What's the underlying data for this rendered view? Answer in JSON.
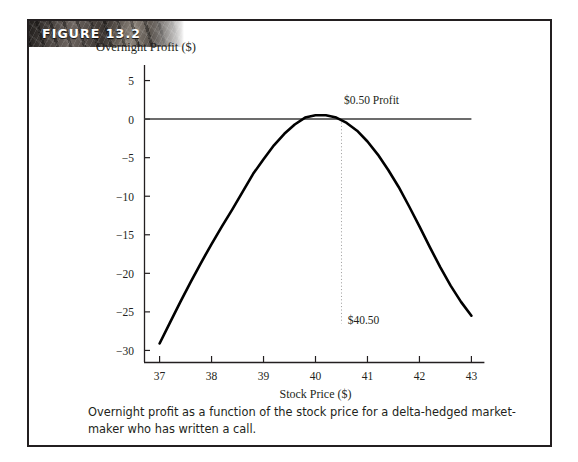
{
  "figure": {
    "banner_label": "FIGURE 13.2",
    "caption": "Overnight profit as a function of the stock price for a delta-hedged market-maker who has written a call."
  },
  "chart_data": {
    "type": "line",
    "title": "",
    "xlabel": "Stock Price ($)",
    "ylabel": "Overnight Profit ($)",
    "xlim": [
      36.7,
      43.3
    ],
    "ylim": [
      -31.5,
      6.5
    ],
    "xticks": [
      37,
      38,
      39,
      40,
      41,
      42,
      43
    ],
    "xtick_labels": [
      "37",
      "38",
      "39",
      "40",
      "41",
      "42",
      "43"
    ],
    "yticks": [
      5,
      0,
      -5,
      -10,
      -15,
      -20,
      -25,
      -30
    ],
    "ytick_labels": [
      "5",
      "0",
      "−5",
      "−10",
      "−15",
      "−20",
      "−25",
      "−30"
    ],
    "grid": false,
    "legend": null,
    "series": [
      {
        "name": "Overnight profit",
        "x": [
          37.0,
          37.2,
          37.4,
          37.6,
          37.8,
          38.0,
          38.2,
          38.4,
          38.6,
          38.8,
          39.0,
          39.2,
          39.4,
          39.6,
          39.8,
          40.0,
          40.2,
          40.4,
          40.6,
          40.8,
          41.0,
          41.2,
          41.4,
          41.6,
          41.8,
          42.0,
          42.2,
          42.4,
          42.6,
          42.8,
          43.0
        ],
        "y": [
          -29.1,
          -26.4,
          -23.7,
          -21.1,
          -18.6,
          -16.2,
          -13.9,
          -11.7,
          -9.4,
          -7.1,
          -5.2,
          -3.4,
          -1.9,
          -0.7,
          0.2,
          0.5,
          0.5,
          0.2,
          -0.5,
          -1.5,
          -2.9,
          -4.6,
          -6.6,
          -8.8,
          -11.3,
          -13.9,
          -16.6,
          -19.2,
          -21.6,
          -23.7,
          -25.5
        ]
      }
    ],
    "reference_lines": [
      {
        "name": "zero-profit-line",
        "orientation": "horizontal",
        "value": 0
      },
      {
        "name": "max-profit-marker",
        "orientation": "vertical",
        "value": 40.5,
        "style": "dotted",
        "from_y": 0,
        "to_y": -26.5
      }
    ],
    "annotations": [
      {
        "name": "profit-annotation",
        "text": "$0.50 Profit",
        "x": 40.55,
        "y": 1.9
      },
      {
        "name": "stock-price-annotation",
        "text": "$40.50",
        "x": 40.62,
        "y": -26.6
      }
    ]
  }
}
